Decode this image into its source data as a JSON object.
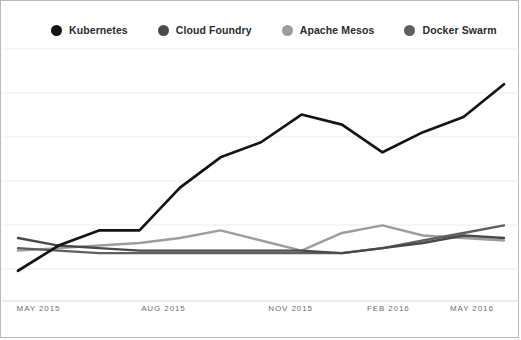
{
  "legend": {
    "position": "top",
    "items": [
      {
        "label": "Kubernetes",
        "color": "#141414",
        "icon": "legend-dot-icon"
      },
      {
        "label": "Cloud Foundry",
        "color": "#4a4a4a",
        "icon": "legend-dot-icon"
      },
      {
        "label": "Apache Mesos",
        "color": "#9d9d9d",
        "icon": "legend-dot-icon"
      },
      {
        "label": "Docker Swarm",
        "color": "#5f5f5f",
        "icon": "legend-dot-icon"
      }
    ]
  },
  "axis": {
    "x_ticks": [
      {
        "label": "MAY 2015",
        "x_pct": 3.0
      },
      {
        "label": "AUG 2015",
        "x_pct": 27.0
      },
      {
        "label": "NOV 2015",
        "x_pct": 51.5
      },
      {
        "label": "FEB 2016",
        "x_pct": 70.5
      },
      {
        "label": "MAY 2016",
        "x_pct": 86.5
      }
    ],
    "gridlines_y": [
      48,
      92,
      136,
      180,
      224,
      268
    ],
    "baseline_y": 300
  },
  "style": {
    "background": "#ffffff",
    "border_color": "#b9b9b9",
    "gridline_color": "#ededed",
    "baseline_color": "#d8d8d8",
    "line_width": 2.4
  },
  "chart_data": {
    "type": "line",
    "title": "",
    "subtitle": "",
    "xlabel": "",
    "ylabel": "",
    "grid": true,
    "legend_position": "top",
    "x": [
      "MAY 2015",
      "JUN 2015",
      "JUL 2015",
      "AUG 2015",
      "SEP 2015",
      "OCT 2015",
      "NOV 2015",
      "DEC 2015",
      "JAN 2016",
      "FEB 2016",
      "MAR 2016",
      "APR 2016",
      "MAY 2016"
    ],
    "ylim": [
      0,
      100
    ],
    "yticks": [
      0,
      16.7,
      33.3,
      50,
      66.7,
      83.3,
      100
    ],
    "series": [
      {
        "name": "Kubernetes",
        "color": "#141414",
        "values": [
          12,
          22,
          28,
          28,
          45,
          57,
          63,
          74,
          70,
          59,
          67,
          73,
          86
        ]
      },
      {
        "name": "Cloud Foundry",
        "color": "#4a4a4a",
        "values": [
          25,
          22,
          21,
          20,
          20,
          20,
          20,
          20,
          19,
          21,
          23,
          26,
          25
        ]
      },
      {
        "name": "Apache Mesos",
        "color": "#9d9d9d",
        "values": [
          20,
          21,
          22,
          23,
          25,
          28,
          24,
          20,
          27,
          30,
          26,
          25,
          24
        ]
      },
      {
        "name": "Docker Swarm",
        "color": "#5f5f5f",
        "values": [
          21,
          20,
          19,
          19,
          19,
          19,
          19,
          19,
          19,
          21,
          24,
          27,
          30
        ]
      }
    ]
  }
}
